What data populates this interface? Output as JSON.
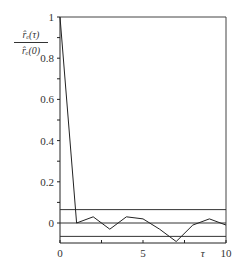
{
  "chart_data": {
    "type": "line",
    "title": "",
    "xlabel": "τ",
    "ylabel_numerator": "r̂ₑ(τ)",
    "ylabel_denominator": "r̂ₑ(0)",
    "x": [
      0,
      1,
      2,
      3,
      4,
      5,
      6,
      7,
      8,
      9,
      10
    ],
    "series": [
      {
        "name": "normalized autocorrelation",
        "values": [
          1.0,
          0.0,
          0.03,
          -0.03,
          0.03,
          0.02,
          -0.03,
          -0.09,
          -0.01,
          0.02,
          -0.01
        ]
      }
    ],
    "confidence_bands": [
      0.065,
      -0.065
    ],
    "zero_line": 0,
    "xlim": [
      0,
      10
    ],
    "ylim": [
      -0.1,
      1.0
    ],
    "xticks": [
      0,
      5,
      10
    ],
    "xtick_labels": [
      "0",
      "5",
      "10"
    ],
    "yticks": [
      0,
      0.2,
      0.4,
      0.6,
      0.8,
      1
    ],
    "ytick_labels": [
      "0",
      "0.2",
      "0.4",
      "0.6",
      "0.8",
      "1"
    ],
    "grid": false,
    "legend": null
  }
}
